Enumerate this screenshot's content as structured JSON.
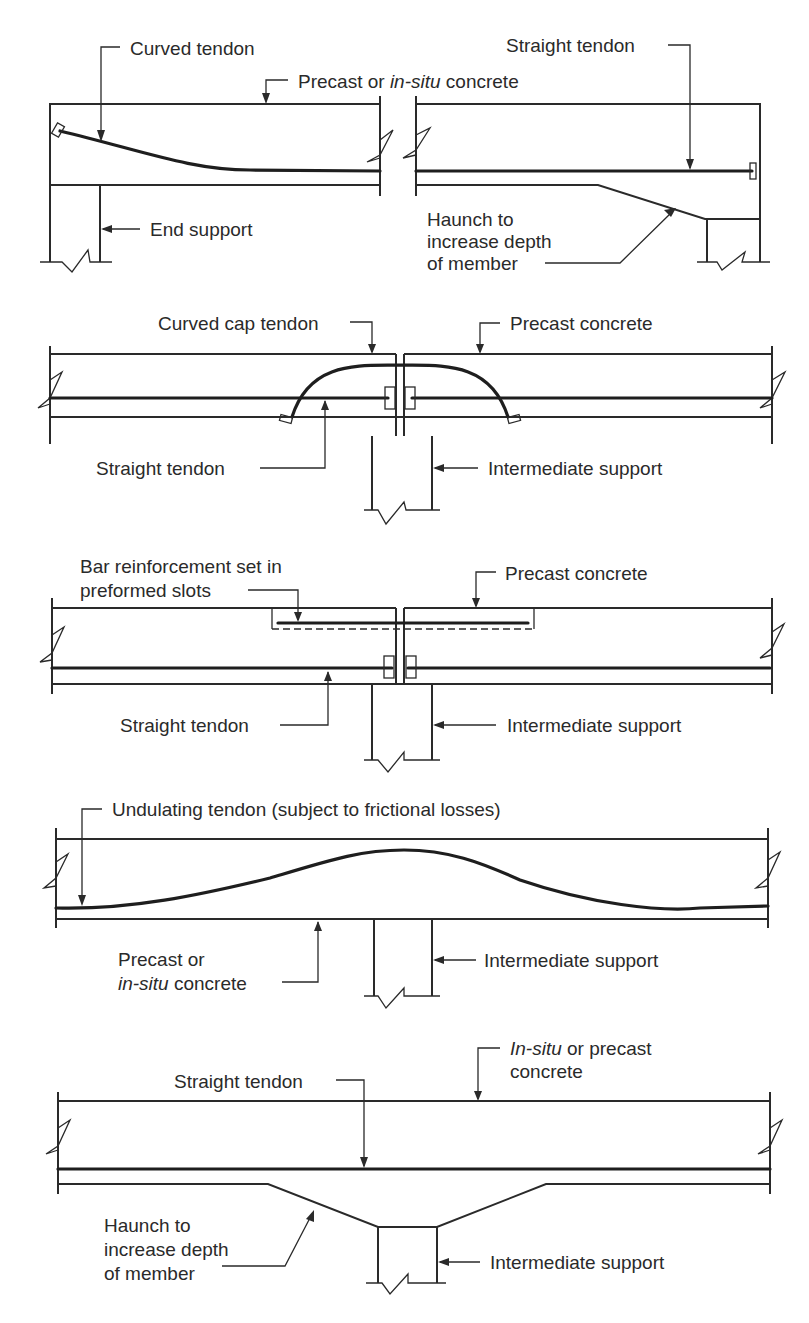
{
  "diagram": {
    "panels": [
      {
        "id": "end-support-curved-tendon",
        "labels": {
          "curved_tendon": "Curved tendon",
          "concrete_pre": "Precast or ",
          "concrete_it": "in-situ",
          "concrete_post": " concrete",
          "straight_tendon": "Straight tendon",
          "end_support": "End support",
          "haunch_1": "Haunch to",
          "haunch_2": "increase depth",
          "haunch_3": "of member"
        }
      },
      {
        "id": "curved-cap-tendon",
        "labels": {
          "cap_tendon": "Curved cap tendon",
          "precast": "Precast concrete",
          "straight_tendon": "Straight tendon",
          "support": "Intermediate support"
        }
      },
      {
        "id": "bar-reinforcement",
        "labels": {
          "bar_1": "Bar reinforcement set in",
          "bar_2": "preformed slots",
          "precast": "Precast concrete",
          "straight_tendon": "Straight tendon",
          "support": "Intermediate support"
        }
      },
      {
        "id": "undulating-tendon",
        "labels": {
          "undulating": "Undulating tendon (subject to frictional losses)",
          "concrete_1": "Precast or",
          "concrete_it": "in-situ",
          "concrete_2": " concrete",
          "support": "Intermediate support"
        }
      },
      {
        "id": "haunched-straight-tendon",
        "labels": {
          "concrete_it": "In-situ",
          "concrete_1": " or precast",
          "concrete_2": "concrete",
          "straight_tendon": "Straight tendon",
          "haunch_1": "Haunch to",
          "haunch_2": "increase depth",
          "haunch_3": "of member",
          "support": "Intermediate support"
        }
      }
    ]
  }
}
